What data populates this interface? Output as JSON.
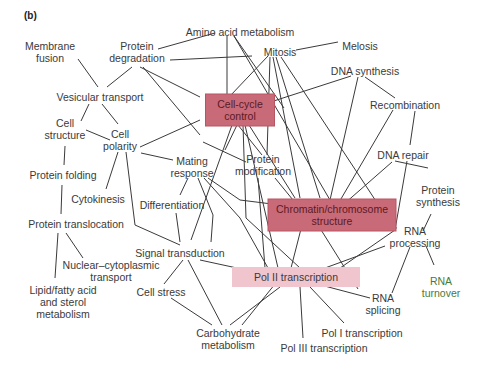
{
  "panel_label": "(b)",
  "colors": {
    "edge": "#3a3a3a",
    "text": "#3a3a3a",
    "strong_box": "#c96a78",
    "strong_box_border": "#b85563",
    "light_box": "#f0c5cd",
    "light_text": "#4a7a3a"
  },
  "nodes": [
    {
      "id": "amino",
      "lines": [
        "Amino acid metabolism"
      ],
      "x": 240,
      "y": 32
    },
    {
      "id": "mitosis",
      "lines": [
        "Mitosis"
      ],
      "x": 280,
      "y": 52
    },
    {
      "id": "melosis",
      "lines": [
        "Melosis"
      ],
      "x": 360,
      "y": 46
    },
    {
      "id": "membrane",
      "lines": [
        "Membrane",
        "fusion"
      ],
      "x": 50,
      "y": 52
    },
    {
      "id": "protdeg",
      "lines": [
        "Protein",
        "degradation"
      ],
      "x": 137,
      "y": 52
    },
    {
      "id": "dnasyn",
      "lines": [
        "DNA synthesis"
      ],
      "x": 365,
      "y": 71
    },
    {
      "id": "vesicular",
      "lines": [
        "Vesicular transport"
      ],
      "x": 100,
      "y": 97
    },
    {
      "id": "cellcycle",
      "lines": [
        "Cell-cycle",
        "control"
      ],
      "x": 240,
      "y": 110,
      "box": "strong"
    },
    {
      "id": "recomb",
      "lines": [
        "Recombination"
      ],
      "x": 405,
      "y": 105
    },
    {
      "id": "cellstruct",
      "lines": [
        "Cell",
        "structure"
      ],
      "x": 65,
      "y": 129
    },
    {
      "id": "cellpol",
      "lines": [
        "Cell",
        "polarity"
      ],
      "x": 120,
      "y": 140
    },
    {
      "id": "mating",
      "lines": [
        "Mating",
        "response"
      ],
      "x": 192,
      "y": 167
    },
    {
      "id": "protmod",
      "lines": [
        "Protein",
        "modification"
      ],
      "x": 263,
      "y": 165
    },
    {
      "id": "dnarep",
      "lines": [
        "DNA repair"
      ],
      "x": 403,
      "y": 155
    },
    {
      "id": "protfold",
      "lines": [
        "Protein folding"
      ],
      "x": 63,
      "y": 175
    },
    {
      "id": "cytokin",
      "lines": [
        "Cytokinesis"
      ],
      "x": 98,
      "y": 199
    },
    {
      "id": "diff",
      "lines": [
        "Differentiation"
      ],
      "x": 172,
      "y": 205
    },
    {
      "id": "chromatin",
      "lines": [
        "Chromatin/chromosome",
        "structure"
      ],
      "x": 332,
      "y": 215,
      "box": "strong"
    },
    {
      "id": "protsyn",
      "lines": [
        "Protein",
        "synthesis"
      ],
      "x": 438,
      "y": 196
    },
    {
      "id": "prottrans",
      "lines": [
        "Protein translocation"
      ],
      "x": 76,
      "y": 224
    },
    {
      "id": "rnaproc",
      "lines": [
        "RNA",
        "processing"
      ],
      "x": 415,
      "y": 237
    },
    {
      "id": "signal",
      "lines": [
        "Signal transduction"
      ],
      "x": 180,
      "y": 253
    },
    {
      "id": "pol2",
      "lines": [
        "Pol II transcription"
      ],
      "x": 296,
      "y": 277,
      "box": "light"
    },
    {
      "id": "nuclear",
      "lines": [
        "Nuclear–cytoplasmic",
        "transport"
      ],
      "x": 111,
      "y": 271
    },
    {
      "id": "rnaturn",
      "lines": [
        "RNA",
        "turnover"
      ],
      "x": 441,
      "y": 287,
      "green": true
    },
    {
      "id": "cellstress",
      "lines": [
        "Cell stress"
      ],
      "x": 161,
      "y": 292
    },
    {
      "id": "lipid",
      "lines": [
        "Lipid/fatty acid",
        "and sterol",
        "metabolism"
      ],
      "x": 63,
      "y": 302
    },
    {
      "id": "rnasplice",
      "lines": [
        "RNA",
        "splicing"
      ],
      "x": 383,
      "y": 304
    },
    {
      "id": "pol1",
      "lines": [
        "Pol I transcription"
      ],
      "x": 362,
      "y": 333
    },
    {
      "id": "carbo",
      "lines": [
        "Carbohydrate",
        "metabolism"
      ],
      "x": 228,
      "y": 339
    },
    {
      "id": "pol3",
      "lines": [
        "Pol III transcription"
      ],
      "x": 324,
      "y": 348
    }
  ],
  "edges": [
    [
      [
        158,
        49
      ],
      [
        215,
        33
      ]
    ],
    [
      [
        170,
        60
      ],
      [
        252,
        56
      ]
    ],
    [
      [
        227,
        36
      ],
      [
        227,
        96
      ]
    ],
    [
      [
        234,
        36
      ],
      [
        284,
        108
      ]
    ],
    [
      [
        234,
        36
      ],
      [
        330,
        200
      ]
    ],
    [
      [
        296,
        50
      ],
      [
        338,
        42
      ]
    ],
    [
      [
        78,
        59
      ],
      [
        98,
        87
      ]
    ],
    [
      [
        107,
        87
      ],
      [
        132,
        67
      ]
    ],
    [
      [
        140,
        67
      ],
      [
        200,
        97
      ]
    ],
    [
      [
        143,
        67
      ],
      [
        200,
        135
      ]
    ],
    [
      [
        89,
        104
      ],
      [
        81,
        121
      ]
    ],
    [
      [
        102,
        104
      ],
      [
        118,
        124
      ]
    ],
    [
      [
        86,
        130
      ],
      [
        110,
        140
      ]
    ],
    [
      [
        140,
        147
      ],
      [
        200,
        120
      ]
    ],
    [
      [
        65,
        146
      ],
      [
        64,
        165
      ]
    ],
    [
      [
        118,
        152
      ],
      [
        106,
        189
      ]
    ],
    [
      [
        126,
        152
      ],
      [
        135,
        225
      ],
      [
        180,
        245
      ]
    ],
    [
      [
        141,
        153
      ],
      [
        173,
        160
      ]
    ],
    [
      [
        62,
        185
      ],
      [
        61,
        214
      ]
    ],
    [
      [
        58,
        233
      ],
      [
        55,
        278
      ]
    ],
    [
      [
        66,
        233
      ],
      [
        83,
        258
      ]
    ],
    [
      [
        268,
        56
      ],
      [
        230,
        96
      ]
    ],
    [
      [
        270,
        57
      ],
      [
        267,
        155
      ]
    ],
    [
      [
        273,
        57
      ],
      [
        300,
        198
      ]
    ],
    [
      [
        276,
        57
      ],
      [
        320,
        198
      ]
    ],
    [
      [
        281,
        57
      ],
      [
        395,
        230
      ]
    ],
    [
      [
        252,
        108
      ],
      [
        351,
        76
      ]
    ],
    [
      [
        358,
        77
      ],
      [
        330,
        200
      ]
    ],
    [
      [
        365,
        77
      ],
      [
        395,
        98
      ]
    ],
    [
      [
        338,
        204
      ],
      [
        393,
        110
      ]
    ],
    [
      [
        415,
        111
      ],
      [
        410,
        145
      ]
    ],
    [
      [
        344,
        204
      ],
      [
        392,
        162
      ]
    ],
    [
      [
        407,
        161
      ],
      [
        395,
        230
      ],
      [
        330,
        275
      ]
    ],
    [
      [
        395,
        161
      ],
      [
        428,
        168
      ]
    ],
    [
      [
        237,
        125
      ],
      [
        225,
        150
      ]
    ],
    [
      [
        238,
        125
      ],
      [
        262,
        155
      ]
    ],
    [
      [
        243,
        125
      ],
      [
        246,
        218
      ],
      [
        300,
        268
      ]
    ],
    [
      [
        245,
        125
      ],
      [
        278,
        268
      ]
    ],
    [
      [
        232,
        125
      ],
      [
        191,
        240
      ]
    ],
    [
      [
        249,
        125
      ],
      [
        295,
        198
      ]
    ],
    [
      [
        275,
        178
      ],
      [
        293,
        200
      ]
    ],
    [
      [
        258,
        178
      ],
      [
        265,
        268
      ]
    ],
    [
      [
        188,
        178
      ],
      [
        180,
        195
      ]
    ],
    [
      [
        198,
        178
      ],
      [
        213,
        215
      ],
      [
        211,
        242
      ]
    ],
    [
      [
        204,
        178
      ],
      [
        240,
        218
      ],
      [
        268,
        268
      ]
    ],
    [
      [
        208,
        178
      ],
      [
        240,
        200
      ],
      [
        272,
        204
      ]
    ],
    [
      [
        176,
        213
      ],
      [
        180,
        242
      ]
    ],
    [
      [
        183,
        260
      ],
      [
        164,
        284
      ]
    ],
    [
      [
        188,
        260
      ],
      [
        222,
        325
      ]
    ],
    [
      [
        200,
        260
      ],
      [
        260,
        273
      ]
    ],
    [
      [
        171,
        298
      ],
      [
        212,
        325
      ]
    ],
    [
      [
        242,
        325
      ],
      [
        275,
        284
      ]
    ],
    [
      [
        302,
        225
      ],
      [
        291,
        268
      ]
    ],
    [
      [
        318,
        225
      ],
      [
        358,
        289
      ]
    ],
    [
      [
        368,
        225
      ],
      [
        397,
        228
      ]
    ],
    [
      [
        325,
        268
      ],
      [
        385,
        246
      ]
    ],
    [
      [
        410,
        247
      ],
      [
        392,
        293
      ]
    ],
    [
      [
        426,
        246
      ],
      [
        434,
        265
      ]
    ],
    [
      [
        431,
        214
      ],
      [
        423,
        231
      ]
    ],
    [
      [
        310,
        287
      ],
      [
        344,
        323
      ]
    ],
    [
      [
        300,
        287
      ],
      [
        303,
        338
      ]
    ],
    [
      [
        280,
        287
      ],
      [
        230,
        325
      ]
    ],
    [
      [
        317,
        284
      ],
      [
        370,
        298
      ]
    ],
    [
      [
        203,
        142
      ],
      [
        246,
        162
      ]
    ]
  ]
}
